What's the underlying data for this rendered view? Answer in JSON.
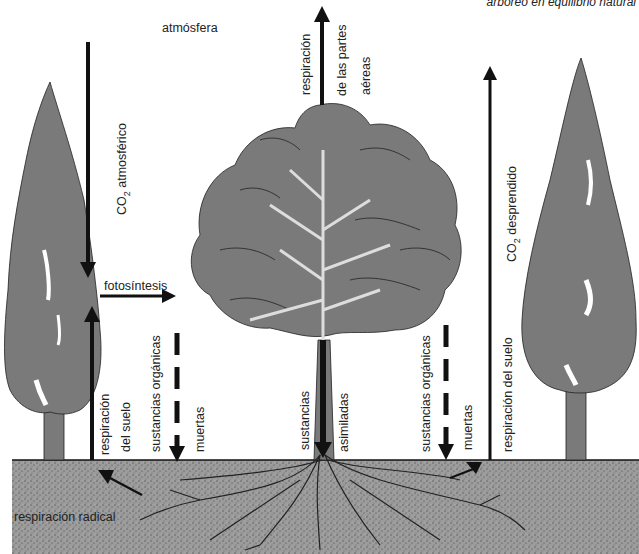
{
  "diagram": {
    "title": "arbóreo en equilibrio natural",
    "labels": {
      "atmosphere": "atmósfera",
      "co2_atmospheric": "CO",
      "co2_atmospheric_sub": "2",
      "co2_atmospheric_rest": " atmosférico",
      "photosynthesis": "fotosíntesis",
      "respiration_aerial_1": "respiración",
      "respiration_aerial_2": "de las partes",
      "respiration_aerial_3": "aéreas",
      "co2_released": "CO",
      "co2_released_sub": "2",
      "co2_released_rest": " desprendido",
      "soil_respiration_left_1": "respiración",
      "soil_respiration_left_2": "del suelo",
      "dead_organic_left_1": "sustancias orgánicas",
      "dead_organic_left_2": "muertas",
      "assimilated_1": "sustancias",
      "assimilated_2": "asimiladas",
      "dead_organic_right_1": "sustancias orgánicas",
      "dead_organic_right_2": "muertas",
      "soil_respiration_right": "respiración del suelo",
      "root_respiration": "respiración radical"
    },
    "colors": {
      "canopy": "#7a7a7a",
      "soil": "#9a9a9a",
      "ink": "#111111",
      "background": "#ffffff"
    }
  }
}
